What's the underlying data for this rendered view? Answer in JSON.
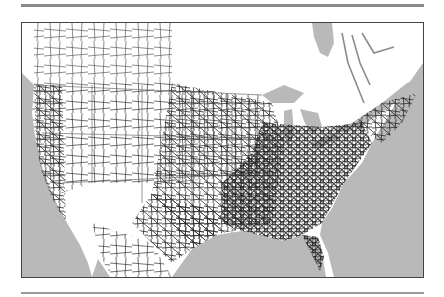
{
  "figure": {
    "type": "network-map",
    "colors": {
      "water": "#b9b9b9",
      "land": "#ffffff",
      "network": "#2a2a2a",
      "canada_network": "#555555",
      "rule": "#8a8a8a",
      "frame": "#444444"
    }
  }
}
